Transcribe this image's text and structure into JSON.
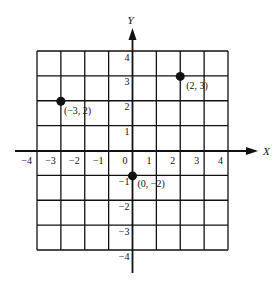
{
  "diagram": {
    "type": "coordinate-plane",
    "x_axis_label": "X",
    "y_axis_label": "Y",
    "x_range": [
      -4,
      4
    ],
    "y_range": [
      -4,
      4
    ],
    "x_ticks": [
      "−4",
      "−3",
      "−2",
      "−1",
      "0",
      "1",
      "2",
      "3",
      "4"
    ],
    "y_ticks": [
      "4",
      "3",
      "2",
      "1",
      "−1",
      "−2",
      "−3",
      "−4"
    ],
    "grid": true,
    "points": [
      {
        "x": -3,
        "y": 2,
        "label": "(−3, 2)"
      },
      {
        "x": 2,
        "y": 3,
        "label": "(2, 3)"
      },
      {
        "x": 0,
        "y": -1,
        "label": "(0,  −2)"
      }
    ],
    "line_color": "#111111",
    "background": "#ffffff"
  }
}
